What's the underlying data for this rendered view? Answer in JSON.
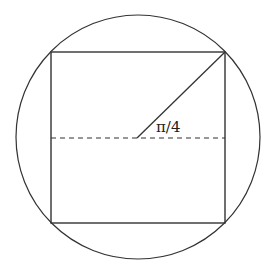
{
  "diagram": {
    "title": "",
    "circle": {
      "cx": 138,
      "cy": 137,
      "r": 122
    },
    "square": {
      "x1": 51,
      "y1": 52,
      "x2": 225,
      "y2": 223
    },
    "dashed_line": {
      "x1": 51,
      "y1": 138,
      "x2": 225,
      "y2": 138
    },
    "diagonal": {
      "x1": 137,
      "y1": 138,
      "x2": 225,
      "y2": 52
    },
    "angle_label": "π/4",
    "stroke_color": "#333333"
  }
}
